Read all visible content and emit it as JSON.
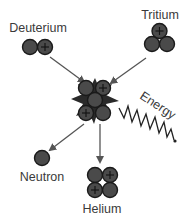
{
  "diagram": {
    "reactants": [
      {
        "name": "deuterium",
        "label": "Deuterium",
        "protons": 1,
        "neutrons": 1
      },
      {
        "name": "tritium",
        "label": "Tritium",
        "protons": 1,
        "neutrons": 2
      }
    ],
    "intermediate": {
      "name": "fused-nucleus",
      "protons": 2,
      "neutrons": 3
    },
    "products": [
      {
        "name": "neutron",
        "label": "Neutron",
        "protons": 0,
        "neutrons": 1
      },
      {
        "name": "helium",
        "label": "Helium",
        "protons": 2,
        "neutrons": 2
      }
    ],
    "energy_label": "Energy",
    "proton_symbol": "+",
    "colors": {
      "nucleon_fill": "#4a4a4a",
      "nucleon_stroke": "#1a1a1a",
      "arrow": "#555555",
      "text": "#3a3a3a"
    }
  }
}
